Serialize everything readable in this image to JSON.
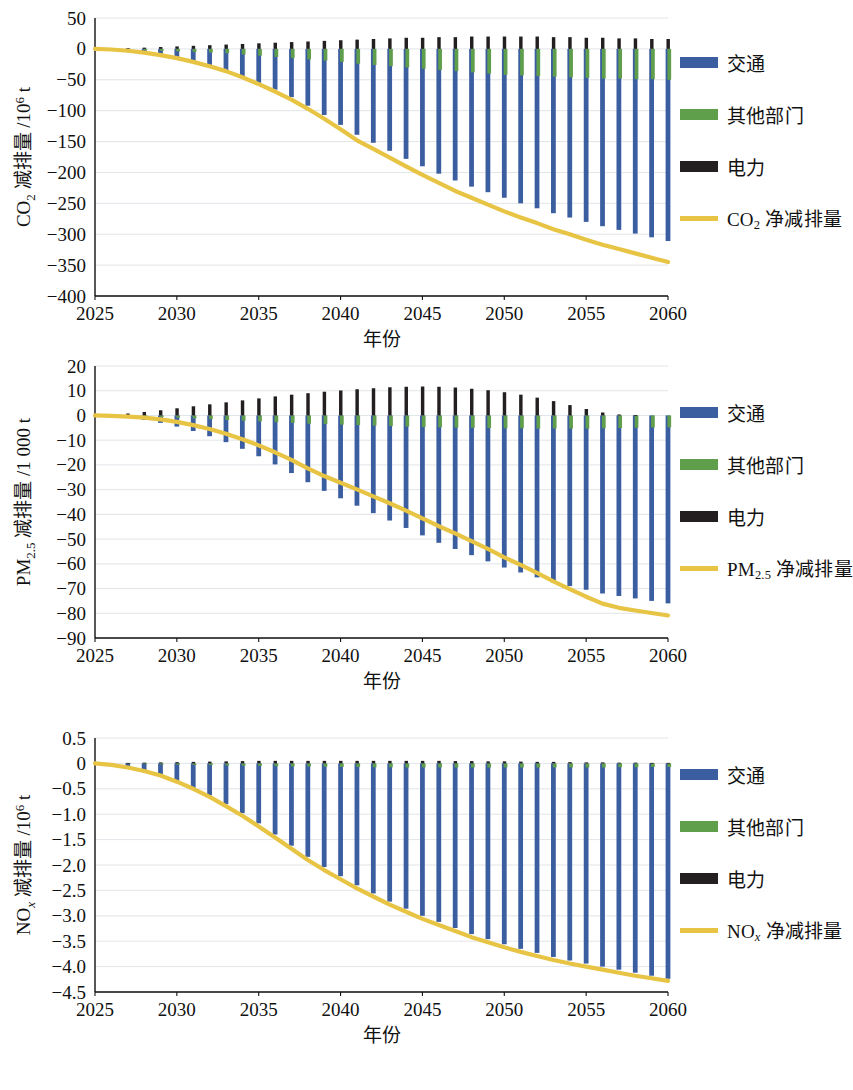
{
  "figure": {
    "panel_count": 3,
    "colors": {
      "transport": "#3b5ea0",
      "other_sectors": "#5f9e4b",
      "power": "#231f20",
      "net_line": "#e8c445",
      "grid": "#d9dde3",
      "axis": "#111111",
      "background": "#ffffff"
    },
    "legend_labels": {
      "transport": "交通",
      "other_sectors": "其他部门",
      "power": "电力"
    }
  },
  "chart_data": [
    {
      "id": "co2",
      "type": "bar",
      "title": "",
      "xlabel": "年份",
      "ylabel": "CO₂ 减排量 /10⁶ t",
      "ylabel_parts": {
        "prefix": "CO",
        "sub": "2",
        "suffix": " 减排量 /10",
        "sup": "6",
        "tail": " t"
      },
      "net_legend": "CO₂ 净减排量",
      "net_legend_parts": {
        "prefix": "CO",
        "sub": "2",
        "tail": " 净减排量"
      },
      "ylim": [
        -400,
        50
      ],
      "yticks": [
        50,
        0,
        -50,
        -100,
        -150,
        -200,
        -250,
        -300,
        -350,
        -400
      ],
      "ytick_labels": [
        "50",
        "0",
        "−50",
        "−100",
        "−150",
        "−200",
        "−250",
        "−300",
        "−350",
        "−400"
      ],
      "xlim": [
        2025,
        2060
      ],
      "xticks": [
        2025,
        2030,
        2035,
        2040,
        2045,
        2050,
        2055,
        2060
      ],
      "xtick_labels": [
        "2025",
        "2030",
        "2035",
        "2040",
        "2045",
        "2050",
        "2055",
        "2060"
      ],
      "grid": true,
      "legend_position": "right",
      "x": [
        2025,
        2026,
        2027,
        2028,
        2029,
        2030,
        2031,
        2032,
        2033,
        2034,
        2035,
        2036,
        2037,
        2038,
        2039,
        2040,
        2041,
        2042,
        2043,
        2044,
        2045,
        2046,
        2047,
        2048,
        2049,
        2050,
        2051,
        2052,
        2053,
        2054,
        2055,
        2056,
        2057,
        2058,
        2059,
        2060
      ],
      "series": [
        {
          "name": "交通",
          "key": "transport",
          "color": "#3b5ea0",
          "values": [
            0,
            -1,
            -3,
            -6,
            -10,
            -15,
            -21,
            -28,
            -36,
            -45,
            -55,
            -66,
            -78,
            -92,
            -107,
            -123,
            -139,
            -152,
            -165,
            -178,
            -190,
            -202,
            -213,
            -223,
            -232,
            -241,
            -250,
            -258,
            -266,
            -273,
            -280,
            -287,
            -293,
            -299,
            -305,
            -311
          ]
        },
        {
          "name": "其他部门",
          "key": "other_sectors",
          "color": "#5f9e4b",
          "values": [
            0,
            -0.5,
            -1,
            -2,
            -3,
            -4,
            -5,
            -6,
            -7,
            -9,
            -11,
            -13,
            -15,
            -17,
            -19,
            -21,
            -24,
            -26,
            -28,
            -30,
            -32,
            -34,
            -36,
            -38,
            -40,
            -42,
            -43,
            -44,
            -45,
            -46,
            -47,
            -48,
            -48,
            -49,
            -49,
            -50
          ]
        },
        {
          "name": "电力",
          "key": "power",
          "color": "#231f20",
          "values": [
            0,
            0.5,
            1,
            2,
            3,
            4,
            5,
            6,
            7,
            8,
            9,
            10,
            11,
            12,
            13,
            14,
            15,
            16,
            17,
            18,
            18,
            19,
            19,
            20,
            20,
            20,
            20,
            20,
            19,
            19,
            18,
            18,
            17,
            17,
            16,
            16
          ]
        },
        {
          "name": "CO₂ 净减排量",
          "key": "net",
          "type": "line",
          "color": "#e8c445",
          "values": [
            0,
            -1,
            -3,
            -6,
            -10,
            -15,
            -21,
            -28,
            -36,
            -46,
            -57,
            -69,
            -82,
            -97,
            -113,
            -130,
            -148,
            -162,
            -176,
            -190,
            -204,
            -217,
            -230,
            -241,
            -252,
            -263,
            -273,
            -282,
            -292,
            -300,
            -309,
            -317,
            -324,
            -331,
            -338,
            -345
          ]
        }
      ]
    },
    {
      "id": "pm25",
      "type": "bar",
      "title": "",
      "xlabel": "年份",
      "ylabel": "PM₂.₅ 减排量 /1 000 t",
      "ylabel_parts": {
        "prefix": "PM",
        "sub": "2.5",
        "tail": " 减排量 /1 000 t"
      },
      "net_legend": "PM₂.₅ 净减排量",
      "net_legend_parts": {
        "prefix": "PM",
        "sub": "2.5",
        "tail": " 净减排量"
      },
      "ylim": [
        -90,
        20
      ],
      "yticks": [
        20,
        10,
        0,
        -10,
        -20,
        -30,
        -40,
        -50,
        -60,
        -70,
        -80,
        -90
      ],
      "ytick_labels": [
        "20",
        "10",
        "0",
        "−10",
        "−20",
        "−30",
        "−40",
        "−50",
        "−60",
        "−70",
        "−80",
        "−90"
      ],
      "xlim": [
        2025,
        2060
      ],
      "xticks": [
        2025,
        2030,
        2035,
        2040,
        2045,
        2050,
        2055,
        2060
      ],
      "xtick_labels": [
        "2025",
        "2030",
        "2035",
        "2040",
        "2045",
        "2050",
        "2055",
        "2060"
      ],
      "grid": true,
      "legend_position": "right",
      "x": [
        2025,
        2026,
        2027,
        2028,
        2029,
        2030,
        2031,
        2032,
        2033,
        2034,
        2035,
        2036,
        2037,
        2038,
        2039,
        2040,
        2041,
        2042,
        2043,
        2044,
        2045,
        2046,
        2047,
        2048,
        2049,
        2050,
        2051,
        2052,
        2053,
        2054,
        2055,
        2056,
        2057,
        2058,
        2059,
        2060
      ],
      "series": [
        {
          "name": "交通",
          "key": "transport",
          "color": "#3b5ea0",
          "values": [
            0,
            -0.4,
            -1.0,
            -1.8,
            -3.0,
            -4.5,
            -6.3,
            -8.4,
            -10.8,
            -13.5,
            -16.5,
            -19.8,
            -23.3,
            -27.0,
            -30.5,
            -33.5,
            -36.5,
            -39.5,
            -42.5,
            -45.5,
            -48.5,
            -51.5,
            -54.0,
            -56.5,
            -59.0,
            -61.5,
            -63.5,
            -65.5,
            -67.5,
            -69.0,
            -70.5,
            -72.0,
            -73.0,
            -74.0,
            -75.0,
            -76.0
          ]
        },
        {
          "name": "其他部门",
          "key": "other_sectors",
          "color": "#5f9e4b",
          "values": [
            0,
            -0.1,
            -0.2,
            -0.4,
            -0.6,
            -0.9,
            -1.2,
            -1.5,
            -1.8,
            -2.1,
            -2.4,
            -2.7,
            -3.0,
            -3.3,
            -3.5,
            -3.7,
            -3.9,
            -4.1,
            -4.3,
            -4.5,
            -4.7,
            -4.8,
            -4.9,
            -5.0,
            -5.1,
            -5.2,
            -5.2,
            -5.3,
            -5.3,
            -5.3,
            -5.3,
            -5.2,
            -5.1,
            -5.0,
            -4.9,
            -4.8
          ]
        },
        {
          "name": "电力",
          "key": "power",
          "color": "#231f20",
          "values": [
            0,
            0.3,
            0.8,
            1.4,
            2.1,
            2.9,
            3.7,
            4.5,
            5.3,
            6.1,
            6.9,
            7.7,
            8.4,
            9.0,
            9.6,
            10.1,
            10.6,
            11.0,
            11.4,
            11.6,
            11.7,
            11.6,
            11.3,
            10.8,
            10.2,
            9.4,
            8.4,
            7.2,
            5.8,
            4.2,
            2.6,
            1.2,
            0.4,
            0.1,
            0.0,
            0.0
          ]
        },
        {
          "name": "PM₂.₅ 净减排量",
          "key": "net",
          "type": "line",
          "color": "#e8c445",
          "values": [
            0,
            -0.2,
            -0.5,
            -0.9,
            -1.6,
            -2.6,
            -3.9,
            -5.5,
            -7.4,
            -9.6,
            -12.1,
            -14.9,
            -18.0,
            -21.4,
            -24.5,
            -27.2,
            -29.9,
            -32.7,
            -35.5,
            -38.5,
            -41.6,
            -44.8,
            -47.7,
            -50.8,
            -54.0,
            -57.4,
            -60.4,
            -63.7,
            -67.1,
            -70.2,
            -73.3,
            -76.1,
            -77.8,
            -78.9,
            -79.9,
            -80.9
          ]
        }
      ]
    },
    {
      "id": "nox",
      "type": "bar",
      "title": "",
      "xlabel": "年份",
      "ylabel": "NOx 减排量 /10⁶ t",
      "ylabel_parts": {
        "prefix": "NO",
        "sub": "x",
        "suffix": " 减排量 /10",
        "sup": "6",
        "tail": " t"
      },
      "net_legend": "NOx 净减排量",
      "net_legend_parts": {
        "prefix": "NO",
        "sub": "x",
        "tail": " 净减排量"
      },
      "ylim": [
        -4.5,
        0.5
      ],
      "yticks": [
        0.5,
        0,
        -0.5,
        -1.0,
        -1.5,
        -2.0,
        -2.5,
        -3.0,
        -3.5,
        -4.0,
        -4.5
      ],
      "ytick_labels": [
        "0.5",
        "0",
        "−0.5",
        "−1.0",
        "−1.5",
        "−2.0",
        "−2.5",
        "−3.0",
        "−3.5",
        "−4.0",
        "−4.5"
      ],
      "xlim": [
        2025,
        2060
      ],
      "xticks": [
        2025,
        2030,
        2035,
        2040,
        2045,
        2050,
        2055,
        2060
      ],
      "xtick_labels": [
        "2025",
        "2030",
        "2035",
        "2040",
        "2045",
        "2050",
        "2055",
        "2060"
      ],
      "grid": true,
      "legend_position": "right",
      "x": [
        2025,
        2026,
        2027,
        2028,
        2029,
        2030,
        2031,
        2032,
        2033,
        2034,
        2035,
        2036,
        2037,
        2038,
        2039,
        2040,
        2041,
        2042,
        2043,
        2044,
        2045,
        2046,
        2047,
        2048,
        2049,
        2050,
        2051,
        2052,
        2053,
        2054,
        2055,
        2056,
        2057,
        2058,
        2059,
        2060
      ],
      "series": [
        {
          "name": "交通",
          "key": "transport",
          "color": "#3b5ea0",
          "values": [
            0,
            -0.03,
            -0.08,
            -0.15,
            -0.24,
            -0.35,
            -0.48,
            -0.63,
            -0.8,
            -0.98,
            -1.18,
            -1.4,
            -1.62,
            -1.84,
            -2.04,
            -2.22,
            -2.4,
            -2.56,
            -2.72,
            -2.86,
            -3.0,
            -3.12,
            -3.24,
            -3.36,
            -3.46,
            -3.56,
            -3.65,
            -3.73,
            -3.81,
            -3.88,
            -3.94,
            -4.0,
            -4.06,
            -4.12,
            -4.18,
            -4.24
          ]
        },
        {
          "name": "其他部门",
          "key": "other_sectors",
          "color": "#5f9e4b",
          "values": [
            0,
            -0.005,
            -0.01,
            -0.015,
            -0.02,
            -0.025,
            -0.03,
            -0.035,
            -0.04,
            -0.045,
            -0.05,
            -0.055,
            -0.06,
            -0.06,
            -0.065,
            -0.07,
            -0.07,
            -0.075,
            -0.075,
            -0.08,
            -0.08,
            -0.08,
            -0.08,
            -0.08,
            -0.08,
            -0.08,
            -0.08,
            -0.08,
            -0.08,
            -0.08,
            -0.08,
            -0.08,
            -0.075,
            -0.075,
            -0.07,
            -0.07
          ]
        },
        {
          "name": "电力",
          "key": "power",
          "color": "#231f20",
          "values": [
            0,
            0.005,
            0.01,
            0.015,
            0.02,
            0.025,
            0.03,
            0.035,
            0.04,
            0.045,
            0.05,
            0.05,
            0.05,
            0.05,
            0.05,
            0.05,
            0.05,
            0.05,
            0.05,
            0.05,
            0.05,
            0.05,
            0.045,
            0.045,
            0.04,
            0.04,
            0.035,
            0.03,
            0.03,
            0.025,
            0.02,
            0.02,
            0.015,
            0.015,
            0.01,
            0.01
          ]
        },
        {
          "name": "NOx 净减排量",
          "key": "net",
          "type": "line",
          "color": "#e8c445",
          "values": [
            0,
            -0.03,
            -0.08,
            -0.15,
            -0.24,
            -0.36,
            -0.5,
            -0.66,
            -0.84,
            -1.03,
            -1.24,
            -1.46,
            -1.68,
            -1.9,
            -2.1,
            -2.28,
            -2.46,
            -2.62,
            -2.78,
            -2.92,
            -3.06,
            -3.18,
            -3.3,
            -3.42,
            -3.52,
            -3.62,
            -3.71,
            -3.79,
            -3.87,
            -3.94,
            -4.0,
            -4.06,
            -4.12,
            -4.18,
            -4.23,
            -4.28
          ]
        }
      ]
    }
  ]
}
